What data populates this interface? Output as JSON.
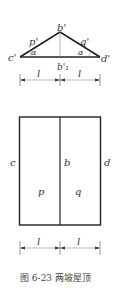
{
  "figure": {
    "caption": "图 6-23   两坡屋顶",
    "elevation": {
      "apex_label": "b'",
      "base_mid_label": "b'₁",
      "left_label": "c'",
      "right_label": "d'",
      "left_slope_label": "p'",
      "right_slope_label": "q'",
      "left_angle_label": "α",
      "right_angle_label": "α",
      "dim_left": "l",
      "dim_right": "l"
    },
    "plan": {
      "left_edge_label": "c",
      "middle_label": "b",
      "right_edge_label": "d",
      "left_face_label": "p",
      "right_face_label": "q",
      "dim_left": "l",
      "dim_right": "l"
    }
  }
}
